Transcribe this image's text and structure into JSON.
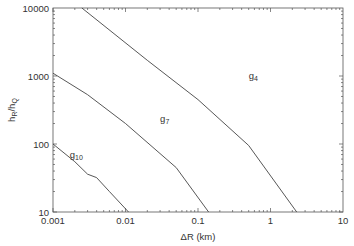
{
  "chart_data": {
    "type": "line",
    "title": "",
    "xlabel": "ΔR (km)",
    "ylabel_main": "h",
    "ylabel_sub1": "R",
    "ylabel_mid": "/h",
    "ylabel_sub2": "Q",
    "xscale": "log",
    "yscale": "log",
    "xlim": [
      0.001,
      10
    ],
    "ylim": [
      10,
      10000
    ],
    "grid": false,
    "legend": "inline labels",
    "x_ticks": [
      {
        "value": 0.001,
        "label": "0.001"
      },
      {
        "value": 0.01,
        "label": "0.01"
      },
      {
        "value": 0.1,
        "label": "0.1"
      },
      {
        "value": 1,
        "label": "1"
      },
      {
        "value": 10,
        "label": "10"
      }
    ],
    "y_ticks": [
      {
        "value": 10,
        "label": "10"
      },
      {
        "value": 100,
        "label": "100"
      },
      {
        "value": 1000,
        "label": "1000"
      },
      {
        "value": 10000,
        "label": "10000"
      }
    ],
    "series": [
      {
        "name": "g4",
        "label_main": "g",
        "label_sub": "4",
        "label_pos": {
          "x": 0.5,
          "y": 900
        },
        "points": [
          [
            0.0025,
            10000
          ],
          [
            0.02,
            1700
          ],
          [
            0.1,
            450
          ],
          [
            0.5,
            95
          ],
          [
            2.3,
            10
          ]
        ]
      },
      {
        "name": "g7",
        "label_main": "g",
        "label_sub": "7",
        "label_pos": {
          "x": 0.03,
          "y": 210
        },
        "points": [
          [
            0.001,
            1100
          ],
          [
            0.003,
            530
          ],
          [
            0.01,
            200
          ],
          [
            0.05,
            45
          ],
          [
            0.14,
            10
          ]
        ]
      },
      {
        "name": "g10",
        "label_main": "g",
        "label_sub": "10",
        "label_pos": {
          "x": 0.0017,
          "y": 62
        },
        "points": [
          [
            0.001,
            100
          ],
          [
            0.002,
            55
          ],
          [
            0.003,
            36
          ],
          [
            0.004,
            32
          ],
          [
            0.006,
            20
          ],
          [
            0.011,
            10
          ]
        ]
      }
    ]
  }
}
